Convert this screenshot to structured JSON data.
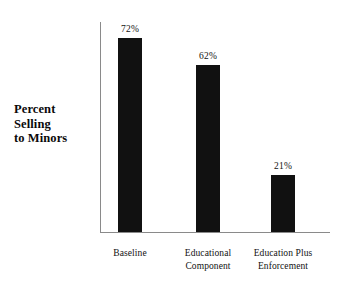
{
  "chart_data": {
    "type": "bar",
    "title": "",
    "subtitle": "",
    "xlabel": "",
    "ylabel": "Percent Selling to Minors",
    "ylabel_lines": [
      "Percent",
      "Selling",
      "to Minors"
    ],
    "categories": [
      "Baseline",
      "Educational Component",
      "Education Plus Enforcement"
    ],
    "category_lines": [
      [
        "Baseline"
      ],
      [
        "Educational",
        "Component"
      ],
      [
        "Education Plus",
        "Enforcement"
      ]
    ],
    "values": [
      72,
      62,
      21
    ],
    "value_labels": [
      "72%",
      "62%",
      "21%"
    ],
    "unit": "%",
    "ylim": [
      0,
      78
    ],
    "grid": false,
    "legend": false,
    "legend_position": "none",
    "tick_labels_y": [],
    "bar_color": "#111111",
    "axis_color": "#8a8a8a",
    "background_color": "#ffffff",
    "text_color": "#111111"
  }
}
